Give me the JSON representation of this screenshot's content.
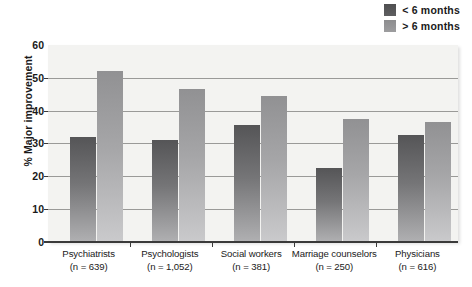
{
  "chart_data": {
    "type": "bar",
    "title": "",
    "xlabel": "",
    "ylabel": "% Major improvement",
    "ylim": [
      0,
      60
    ],
    "yticks": [
      0,
      10,
      20,
      30,
      40,
      50,
      60
    ],
    "grid": true,
    "legend_position": "top-right",
    "categories": [
      "Psychiatrists",
      "Psychologists",
      "Social workers",
      "Marriage counselors",
      "Physicians"
    ],
    "category_sublabels": [
      "(n = 639)",
      "(n = 1,052)",
      "(n = 381)",
      "(n = 250)",
      "(n = 616)"
    ],
    "category_n": [
      639,
      1052,
      381,
      250,
      616
    ],
    "series": [
      {
        "name": "< 6 months",
        "color": "#58585a",
        "values": [
          32,
          31,
          35.5,
          22.5,
          32.5
        ]
      },
      {
        "name": "> 6 months",
        "color": "#949496",
        "values": [
          52,
          46.5,
          44.5,
          37.5,
          36.5
        ]
      }
    ]
  },
  "legend": {
    "items": [
      {
        "label": "< 6 months",
        "swatch_icon": "dark-square-swatch-icon"
      },
      {
        "label": "> 6 months",
        "swatch_icon": "light-square-swatch-icon"
      }
    ]
  },
  "axes": {
    "y_title": "% Major improvement",
    "y_tick_labels": [
      "60",
      "50",
      "40",
      "30",
      "20",
      "10",
      "0"
    ]
  },
  "colors": {
    "series_dark_top": "#555557",
    "series_dark_bottom": "#b0b0b2",
    "series_light_top": "#919193",
    "series_light_bottom": "#cacacc",
    "plot_background": "#f3f3f1",
    "gridline": "#9a9a98",
    "axis": "#3a3a3a",
    "text": "#1a1a1a"
  }
}
